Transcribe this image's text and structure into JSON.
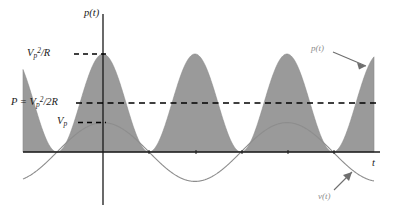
{
  "figure": {
    "name": "rectified-power-waveform-plot",
    "background": "#ffffff"
  },
  "axes": {
    "vertical_axis_label": "p(t)",
    "horizontal_axis_label": "t",
    "vertical_axis_x_px": 103,
    "horizontal_axis_y_px": 152
  },
  "y_tick_labels": [
    {
      "name": "peak-power-label",
      "html": "V<sub>p</sub><sup>2</sup>/R",
      "text": "Vp^2/R",
      "y_px": 54
    },
    {
      "name": "average-power-label",
      "html": "P = V<sub>p</sub><sup>2</sup>/2R",
      "text": "P = Vp^2/2R",
      "y_px": 103
    },
    {
      "name": "peak-voltage-label",
      "html": "V<sub>p</sub>",
      "text": "Vp",
      "y_px": 123
    }
  ],
  "annotations": [
    {
      "name": "power-curve-annotation",
      "html": "p(t)",
      "text": "p(t)",
      "color": "#8d8d8d"
    },
    {
      "name": "voltage-curve-annotation",
      "html": "v(t)",
      "text": "v(t)",
      "color": "#8d8d8d"
    }
  ],
  "colors": {
    "fill_gray": "#9a9a9a",
    "curve_gray": "#8d8d8d",
    "axis_black": "#1a1a1a",
    "dashed_black": "#000000",
    "background": "#ffffff"
  },
  "chart_data": {
    "type": "line",
    "title": "",
    "subtitle": "",
    "xlabel": "t",
    "ylabel": "p(t)",
    "grid": false,
    "legend": "inline-annotations",
    "xlim": [
      -0.5,
      3.0
    ],
    "ylim": [
      -1.0,
      1.15
    ],
    "gridlines_dashed": [
      {
        "label": "Vp^2/R",
        "value": 1.0
      },
      {
        "label": "P = Vp^2/2R",
        "value": 0.5
      },
      {
        "label": "Vp",
        "value": 0.3
      }
    ],
    "series": [
      {
        "name": "p(t)",
        "label": "p(t)",
        "type": "area",
        "formula": "Vp^2/R * cos^2(pi*t)",
        "color": "#9a9a9a",
        "filled": true,
        "peak_value": 1.0,
        "mean_value": 0.5,
        "period": 1.0,
        "peaks_at_t": [
          0,
          1,
          2,
          3
        ],
        "zeros_at_t": [
          -0.5,
          0.5,
          1.5,
          2.5
        ],
        "x": [
          -0.5,
          -0.4,
          -0.3,
          -0.2,
          -0.1,
          0.0,
          0.1,
          0.2,
          0.3,
          0.4,
          0.5,
          0.6,
          0.7,
          0.8,
          0.9,
          1.0,
          1.1,
          1.2,
          1.3,
          1.4,
          1.5,
          1.6,
          1.7,
          1.8,
          1.9,
          2.0,
          2.1,
          2.2,
          2.3,
          2.4,
          2.5,
          2.6,
          2.7,
          2.8,
          2.9,
          3.0
        ],
        "values": [
          0.0,
          0.095,
          0.345,
          0.655,
          0.905,
          1.0,
          0.905,
          0.655,
          0.345,
          0.095,
          0.0,
          0.095,
          0.345,
          0.655,
          0.905,
          1.0,
          0.905,
          0.655,
          0.345,
          0.095,
          0.0,
          0.095,
          0.345,
          0.655,
          0.905,
          1.0,
          0.905,
          0.655,
          0.345,
          0.095,
          0.0,
          0.095,
          0.345,
          0.655,
          0.905,
          1.0
        ]
      },
      {
        "name": "v(t)",
        "label": "v(t)",
        "type": "line",
        "formula": "Vp * cos(pi*t)",
        "color": "#8d8d8d",
        "filled": false,
        "peak_value": 0.3,
        "period": 2.0,
        "x": [
          -0.5,
          -0.4,
          -0.3,
          -0.2,
          -0.1,
          0.0,
          0.1,
          0.2,
          0.3,
          0.4,
          0.5,
          0.6,
          0.7,
          0.8,
          0.9,
          1.0,
          1.1,
          1.2,
          1.3,
          1.4,
          1.5,
          1.6,
          1.7,
          1.8,
          1.9,
          2.0,
          2.1,
          2.2,
          2.3,
          2.4,
          2.5,
          2.6,
          2.7,
          2.8,
          2.9,
          3.0
        ],
        "values": [
          0.0,
          0.093,
          0.176,
          0.243,
          0.285,
          0.3,
          0.285,
          0.243,
          0.176,
          0.093,
          0.0,
          -0.093,
          -0.176,
          -0.243,
          -0.285,
          -0.3,
          -0.285,
          -0.243,
          -0.176,
          -0.093,
          0.0,
          0.093,
          0.176,
          0.243,
          0.285,
          0.3,
          0.285,
          0.243,
          0.176,
          0.093,
          0.0,
          -0.093,
          -0.176,
          -0.243,
          -0.285,
          -0.3
        ]
      }
    ]
  }
}
